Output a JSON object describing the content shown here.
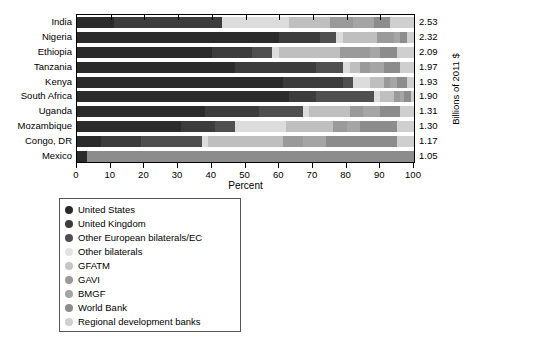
{
  "chart_data": {
    "type": "bar",
    "orientation": "horizontal",
    "stacked": true,
    "title": "",
    "xlabel": "Percent",
    "ylabel": "",
    "right_axis_label": "Billions of 2011 $",
    "xlim": [
      0,
      100
    ],
    "xticks": [
      0,
      10,
      20,
      30,
      40,
      50,
      60,
      70,
      80,
      90,
      100
    ],
    "grid": false,
    "legend_position": "below-left",
    "categories": [
      "India",
      "Nigeria",
      "Ethiopia",
      "Tanzania",
      "Kenya",
      "South Africa",
      "Uganda",
      "Mozambique",
      "Congo, DR",
      "Mexico"
    ],
    "value_labels": [
      "2.53",
      "2.32",
      "2.09",
      "1.97",
      "1.93",
      "1.90",
      "1.31",
      "1.30",
      "1.17",
      "1.05"
    ],
    "value_label_units": "Billions of 2011 $",
    "series": [
      {
        "name": "United States",
        "color": "#2b2b2b",
        "values": [
          11,
          60,
          40,
          47,
          61,
          63,
          38,
          31,
          7,
          3
        ]
      },
      {
        "name": "United Kingdom",
        "color": "#3c3c3c",
        "values": [
          32,
          12,
          12,
          24,
          18,
          8,
          16,
          10,
          12,
          0
        ]
      },
      {
        "name": "Other European bilaterals/EC",
        "color": "#4f4f4f",
        "values": [
          0,
          5,
          6,
          8,
          3,
          17,
          13,
          6,
          18,
          0
        ]
      },
      {
        "name": "Other bilaterals",
        "color": "#dcdcdc",
        "values": [
          20,
          2,
          2,
          2,
          5,
          2,
          2,
          15,
          2,
          0
        ]
      },
      {
        "name": "GFATM",
        "color": "#bfbfbf",
        "values": [
          12,
          10,
          18,
          3,
          4,
          4,
          12,
          14,
          22,
          0
        ]
      },
      {
        "name": "GAVI",
        "color": "#9a9a9a",
        "values": [
          7,
          5,
          9,
          3,
          2,
          2,
          4,
          4,
          6,
          0
        ]
      },
      {
        "name": "BMGF",
        "color": "#a5a5a5",
        "values": [
          6,
          2,
          3,
          4,
          2,
          1,
          5,
          4,
          7,
          0
        ]
      },
      {
        "name": "World Bank",
        "color": "#8c8c8c",
        "values": [
          5,
          2,
          5,
          5,
          3,
          2,
          6,
          11,
          21,
          97
        ]
      },
      {
        "name": "Regional development banks",
        "color": "#cfcfcf",
        "values": [
          7,
          2,
          5,
          4,
          2,
          1,
          4,
          5,
          5,
          0
        ]
      }
    ]
  },
  "legend": {
    "items": [
      {
        "label": "United States",
        "color": "#2b2b2b"
      },
      {
        "label": "United Kingdom",
        "color": "#3c3c3c"
      },
      {
        "label": "Other European bilaterals/EC",
        "color": "#4f4f4f"
      },
      {
        "label": "Other bilaterals",
        "color": "#e2e2e2"
      },
      {
        "label": "GFATM",
        "color": "#c6c6c6"
      },
      {
        "label": "GAVI",
        "color": "#9a9a9a"
      },
      {
        "label": "BMGF",
        "color": "#a5a5a5"
      },
      {
        "label": "World Bank",
        "color": "#8c8c8c"
      },
      {
        "label": "Regional development banks",
        "color": "#cfcfcf"
      }
    ]
  }
}
